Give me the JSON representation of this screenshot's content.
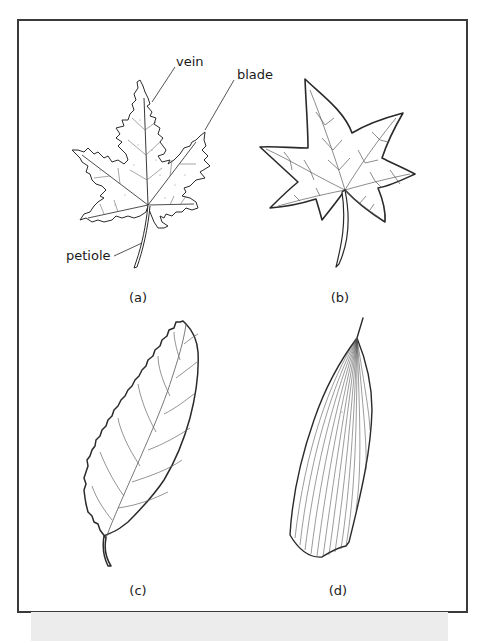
{
  "figure": {
    "panels": [
      {
        "id": "a",
        "caption": "(a)",
        "description": "maple-type palmately lobed leaf with serrated margins",
        "labels": [
          {
            "text": "vein"
          },
          {
            "text": "blade"
          },
          {
            "text": "petiole"
          }
        ]
      },
      {
        "id": "b",
        "caption": "(b)",
        "description": "star-shaped five-lobed leaf with smooth margins and branching veins"
      },
      {
        "id": "c",
        "caption": "(c)",
        "description": "elliptical leaf with serrated margin and pinnate venation"
      },
      {
        "id": "d",
        "caption": "(d)",
        "description": "narrow grass-like leaf with parallel venation"
      }
    ],
    "colors": {
      "stroke": "#2a2a2a",
      "vein": "#555555",
      "frame": "#3a3a3a",
      "strip": "#ececec"
    }
  }
}
